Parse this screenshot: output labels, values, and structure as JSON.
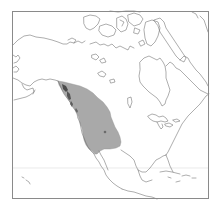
{
  "map": {
    "type": "species-range-map",
    "region": "North America",
    "projection_frame": true,
    "colors": {
      "background": "#ffffff",
      "coastline": "#6a6a6a",
      "frame": "#8a8a8a",
      "range_fill": "#a9a9a9",
      "range_marker": "#6b6b6b",
      "reference_line": "#dcdcdc"
    },
    "layers": [
      {
        "name": "coastlines",
        "label": ""
      },
      {
        "name": "range",
        "label": ""
      },
      {
        "name": "point-marker",
        "label": ""
      },
      {
        "name": "reference-latitude-line",
        "label": ""
      }
    ]
  }
}
